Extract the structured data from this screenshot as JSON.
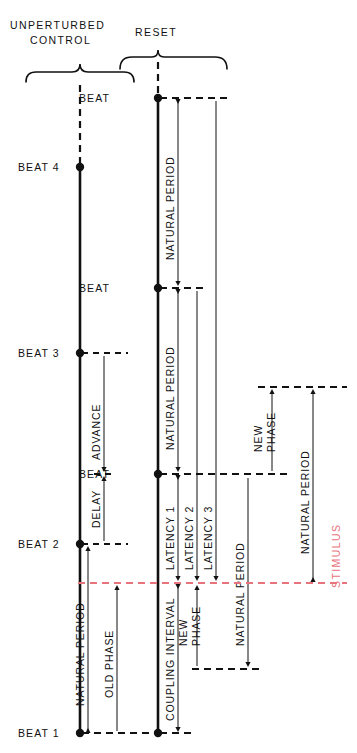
{
  "figure": {
    "type": "timing-diagram",
    "title_left": "UNPERTURBED\nCONTROL",
    "headers": {
      "left_line1": "UNPERTURBED",
      "left_line2": "CONTROL",
      "right": "RESET"
    },
    "colors": {
      "ink": "#111111",
      "stimulus": "#e8737d",
      "background": "#ffffff"
    }
  },
  "control_column": {
    "beats": [
      {
        "label": "BEAT 4",
        "y": 167
      },
      {
        "label": "BEAT 3",
        "y": 353
      },
      {
        "label": "BEAT 2",
        "y": 544
      },
      {
        "label": "BEAT 1",
        "y": 733
      }
    ],
    "intervals": [
      {
        "label": "ADVANCE",
        "from_y": 353,
        "to_y": 474
      },
      {
        "label": "DELAY",
        "from_y": 474,
        "to_y": 544
      },
      {
        "label": "NATURAL PERIOD",
        "from_y": 544,
        "to_y": 733
      },
      {
        "label": "OLD PHASE",
        "from_y": 583,
        "to_y": 733
      }
    ]
  },
  "reset_column": {
    "beats": [
      {
        "label": "BEAT",
        "y": 98
      },
      {
        "label": "BEAT",
        "y": 288
      },
      {
        "label": "BEAT",
        "y": 474
      },
      {
        "label": "BEAT 1",
        "y": 733
      }
    ],
    "intervals": [
      {
        "label": "NATURAL PERIOD",
        "from_y": 98,
        "to_y": 288
      },
      {
        "label": "NATURAL PERIOD",
        "from_y": 288,
        "to_y": 474
      },
      {
        "label": "LATENCY 1",
        "from_y": 474,
        "to_y": 583
      },
      {
        "label": "LATENCY 2",
        "from_y": 288,
        "to_y": 583
      },
      {
        "label": "LATENCY 3",
        "from_y": 98,
        "to_y": 583
      },
      {
        "label": "COUPLING INTERVAL",
        "from_y": 583,
        "to_y": 733
      },
      {
        "label": "NEW PHASE",
        "from_y": 583,
        "to_y": 669
      },
      {
        "label": "NATURAL PERIOD",
        "from_y": 474,
        "to_y": 669
      },
      {
        "label": "NEW PHASE",
        "from_y": 387,
        "to_y": 474
      },
      {
        "label": "NATURAL PERIOD",
        "from_y": 387,
        "to_y": 583
      }
    ]
  },
  "stimulus": {
    "label": "STIMULUS",
    "y": 583,
    "color": "#e8737d"
  },
  "labels": {
    "beat": "BEAT",
    "beat_1": "BEAT 1",
    "beat_2": "BEAT 2",
    "beat_3": "BEAT 3",
    "beat_4": "BEAT 4",
    "advance": "ADVANCE",
    "delay": "DELAY",
    "natural_period": "NATURAL PERIOD",
    "old_phase": "OLD PHASE",
    "new_phase_line1": "NEW",
    "new_phase_line2": "PHASE",
    "latency_1": "LATENCY 1",
    "latency_2": "LATENCY 2",
    "latency_3": "LATENCY 3",
    "coupling_interval": "COUPLING INTERVAL",
    "unperturbed": "UNPERTURBED",
    "control": "CONTROL",
    "reset": "RESET",
    "stimulus": "STIMULUS"
  }
}
